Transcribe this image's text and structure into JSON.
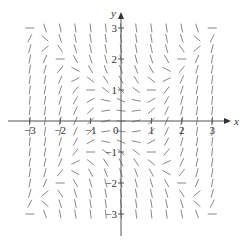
{
  "chart_data": {
    "type": "slope_field",
    "title": "",
    "equation": "dy/dx = x^2 - y^2",
    "xlabel": "x",
    "ylabel": "y",
    "xlim": [
      -3.3,
      3.3
    ],
    "ylim": [
      -3.3,
      3.3
    ],
    "grid": false,
    "legend": null,
    "x_ticks": [
      -3,
      -2,
      -1,
      1,
      2,
      3
    ],
    "x_tick_labels": [
      "−3",
      "−2",
      "−1",
      "1",
      "2",
      "3"
    ],
    "y_ticks": [
      -3,
      -2,
      -1,
      1,
      2,
      3
    ],
    "y_tick_labels": [
      "−3",
      "−2",
      "−1",
      "1",
      "2",
      "3"
    ],
    "origin_label": "0",
    "sample_grid": {
      "x_start": -3,
      "x_end": 3,
      "x_step": 0.5,
      "y_start": -3,
      "y_end": 3,
      "y_step": 0.3333333
    },
    "segment_length_px": 9,
    "colors": {
      "axis": "#555555",
      "segment": "#888888",
      "text": "#333333"
    }
  },
  "layout": {
    "origin_px": [
      121,
      121
    ],
    "x_scale_px": 30.4,
    "y_scale_px": 31.0
  }
}
